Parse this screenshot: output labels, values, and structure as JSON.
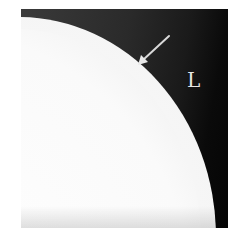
{
  "image": {
    "kind": "grayscale radiograph",
    "frame": {
      "left": 21,
      "top": 9,
      "width": 207,
      "height": 219
    },
    "colors": {
      "background_dark": "#050505",
      "background_gray": "#3a3a3a",
      "bright_region": "#fafafa",
      "annotation": "#e6e6e6"
    },
    "annotations": {
      "side_marker": "L",
      "arrow": {
        "from": [
          148,
          27
        ],
        "to": [
          117,
          56
        ],
        "direction": "pointing down-left at boundary"
      }
    }
  }
}
